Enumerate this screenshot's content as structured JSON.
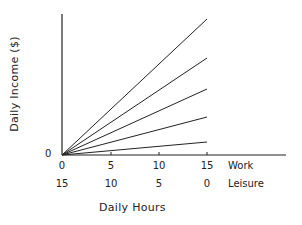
{
  "chart_data": {
    "type": "line",
    "title": "",
    "xlabel": "Daily Hours",
    "ylabel": "Daily Income ($)",
    "x_axis_rows": [
      {
        "name": "Work",
        "ticks": [
          "0",
          "5",
          "10",
          "15"
        ]
      },
      {
        "name": "Leisure",
        "ticks": [
          "15",
          "10",
          "5",
          "0"
        ]
      }
    ],
    "y_ticks": [
      "0"
    ],
    "x": [
      0,
      15
    ],
    "series": [
      {
        "name": "wage line 1 (highest)",
        "values": [
          0,
          136
        ]
      },
      {
        "name": "wage line 2",
        "values": [
          0,
          97
        ]
      },
      {
        "name": "wage line 3",
        "values": [
          0,
          66
        ]
      },
      {
        "name": "wage line 4",
        "values": [
          0,
          38
        ]
      },
      {
        "name": "wage line 5 (lowest)",
        "values": [
          0,
          13
        ]
      }
    ],
    "xlim": [
      0,
      23
    ],
    "ylim": [
      0,
      141
    ],
    "grid": false,
    "legend": "none"
  },
  "labels": {
    "ylabel": "Daily Income ($)",
    "y_zero": "0",
    "work_row_name": "Work",
    "leisure_row_name": "Leisure",
    "work_ticks": [
      "0",
      "5",
      "10",
      "15"
    ],
    "leisure_ticks": [
      "15",
      "10",
      "5",
      "0"
    ],
    "xlabel": "Daily Hours"
  }
}
